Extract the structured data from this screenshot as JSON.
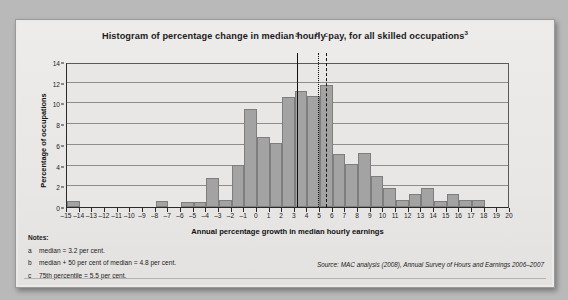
{
  "figure": {
    "title": "Histogram of percentage change in median hourly pay, for all skilled occupations",
    "title_superscript": "3",
    "source": "Source: MAC analysis (2008), Annual Survey of Hours and Earnings 2006–2007",
    "notes_heading": "Notes:",
    "notes": [
      {
        "key": "a",
        "text": "median = 3.2 per cent."
      },
      {
        "key": "b",
        "text": "median + 50 per cent of median = 4.8 per cent."
      },
      {
        "key": "c",
        "text": "75th percentile = 5.5 per cent."
      }
    ]
  },
  "colors": {
    "bar_fill": "#a3a3a3",
    "bar_stroke": "#7e7e7e",
    "axis": "#2a2a2a",
    "grid": "#8d8d8d",
    "paper": "#eceae8",
    "page": "#b9b9b9",
    "text": "#1b1b1b"
  },
  "chart_data": {
    "type": "bar",
    "title": "Histogram of percentage change in median hourly pay, for all skilled occupations",
    "xlabel": "Annual percentage growth in median hourly earnings",
    "ylabel": "Percentage of occupations",
    "xlim": [
      -15,
      20
    ],
    "ylim": [
      0,
      14
    ],
    "ytick_step": 2,
    "yticks": [
      0,
      2,
      4,
      6,
      8,
      10,
      12,
      14
    ],
    "xticks": [
      -15,
      -14,
      -13,
      -12,
      -11,
      -10,
      -9,
      -8,
      -7,
      -6,
      -5,
      -4,
      -3,
      -2,
      -1,
      0,
      1,
      2,
      3,
      4,
      5,
      6,
      7,
      8,
      9,
      10,
      11,
      12,
      13,
      14,
      15,
      16,
      17,
      18,
      19,
      20
    ],
    "xtick_labels": [
      "–15",
      "–14",
      "–13",
      "–12",
      "–11",
      "–10",
      "–9",
      "–8",
      "–7",
      "–6",
      "–5",
      "–4",
      "–3",
      "–2",
      "–1",
      "0",
      "1",
      "2",
      "3",
      "4",
      "5",
      "6",
      "7",
      "8",
      "9",
      "10",
      "11",
      "12",
      "13",
      "14",
      "15",
      "16",
      "17",
      "18",
      "19",
      "20"
    ],
    "grid": "horizontal",
    "legend": "none",
    "bin_width": 1,
    "bins": [
      {
        "left": -15,
        "right": -14,
        "value": 0.55
      },
      {
        "left": -14,
        "right": -13,
        "value": 0
      },
      {
        "left": -13,
        "right": -12,
        "value": 0
      },
      {
        "left": -12,
        "right": -11,
        "value": 0
      },
      {
        "left": -11,
        "right": -10,
        "value": 0
      },
      {
        "left": -10,
        "right": -9,
        "value": 0
      },
      {
        "left": -9,
        "right": -8,
        "value": 0
      },
      {
        "left": -8,
        "right": -7,
        "value": 0.6
      },
      {
        "left": -7,
        "right": -6,
        "value": 0
      },
      {
        "left": -6,
        "right": -5,
        "value": 0.45
      },
      {
        "left": -5,
        "right": -4,
        "value": 0.45
      },
      {
        "left": -4,
        "right": -3,
        "value": 2.8
      },
      {
        "left": -3,
        "right": -2,
        "value": 0.65
      },
      {
        "left": -2,
        "right": -1,
        "value": 4.1
      },
      {
        "left": -1,
        "right": 0,
        "value": 9.5
      },
      {
        "left": 0,
        "right": 1,
        "value": 6.75
      },
      {
        "left": 1,
        "right": 2,
        "value": 6.2
      },
      {
        "left": 2,
        "right": 3,
        "value": 10.6
      },
      {
        "left": 3,
        "right": 4,
        "value": 11.2
      },
      {
        "left": 4,
        "right": 5,
        "value": 10.7
      },
      {
        "left": 5,
        "right": 6,
        "value": 11.75
      },
      {
        "left": 6,
        "right": 7,
        "value": 5.15
      },
      {
        "left": 7,
        "right": 8,
        "value": 4.2
      },
      {
        "left": 8,
        "right": 9,
        "value": 5.2
      },
      {
        "left": 9,
        "right": 10,
        "value": 2.95
      },
      {
        "left": 10,
        "right": 11,
        "value": 1.85
      },
      {
        "left": 11,
        "right": 12,
        "value": 0.7
      },
      {
        "left": 12,
        "right": 13,
        "value": 1.25
      },
      {
        "left": 13,
        "right": 14,
        "value": 1.85
      },
      {
        "left": 14,
        "right": 15,
        "value": 0.6
      },
      {
        "left": 15,
        "right": 16,
        "value": 1.25
      },
      {
        "left": 16,
        "right": 17,
        "value": 0.65
      },
      {
        "left": 17,
        "right": 18,
        "value": 0.7
      },
      {
        "left": 18,
        "right": 19,
        "value": 0
      },
      {
        "left": 19,
        "right": 20,
        "value": 0
      }
    ],
    "reference_lines": [
      {
        "label": "a",
        "x": 3.2,
        "style": "solid",
        "description": "median = 3.2 per cent."
      },
      {
        "label": "b",
        "x": 4.8,
        "style": "dotted",
        "description": "median + 50 per cent of median = 4.8 per cent."
      },
      {
        "label": "c",
        "x": 5.5,
        "style": "dashed",
        "description": "75th percentile = 5.5 per cent."
      }
    ]
  }
}
